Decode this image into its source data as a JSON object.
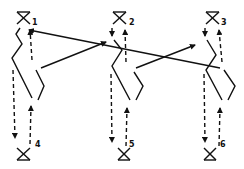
{
  "diagram": {
    "type": "hand-drawn flow diagram",
    "stroke_color": "#111111",
    "background": "#ffffff",
    "nodes": [
      {
        "id": "1",
        "label": "1",
        "position": "top",
        "column": 1
      },
      {
        "id": "2",
        "label": "2",
        "position": "top",
        "column": 2
      },
      {
        "id": "3",
        "label": "3",
        "position": "top",
        "column": 3
      },
      {
        "id": "4",
        "label": "4",
        "position": "bottom",
        "column": 1
      },
      {
        "id": "5",
        "label": "5",
        "position": "bottom",
        "column": 2
      },
      {
        "id": "6",
        "label": "6",
        "position": "bottom",
        "column": 3
      }
    ],
    "edges": [
      {
        "from": "column2",
        "to": "1",
        "style": "solid",
        "arrow": true
      },
      {
        "from": "column1",
        "to": "2",
        "style": "solid",
        "arrow": true
      },
      {
        "from": "column2",
        "to": "3",
        "style": "solid",
        "arrow": true
      },
      {
        "from": "top",
        "to": "bottom",
        "style": "dashed",
        "arrow": true,
        "note": "per column down"
      },
      {
        "from": "bottom",
        "to": "top",
        "style": "dashed",
        "arrow": true,
        "note": "per column up"
      }
    ]
  }
}
